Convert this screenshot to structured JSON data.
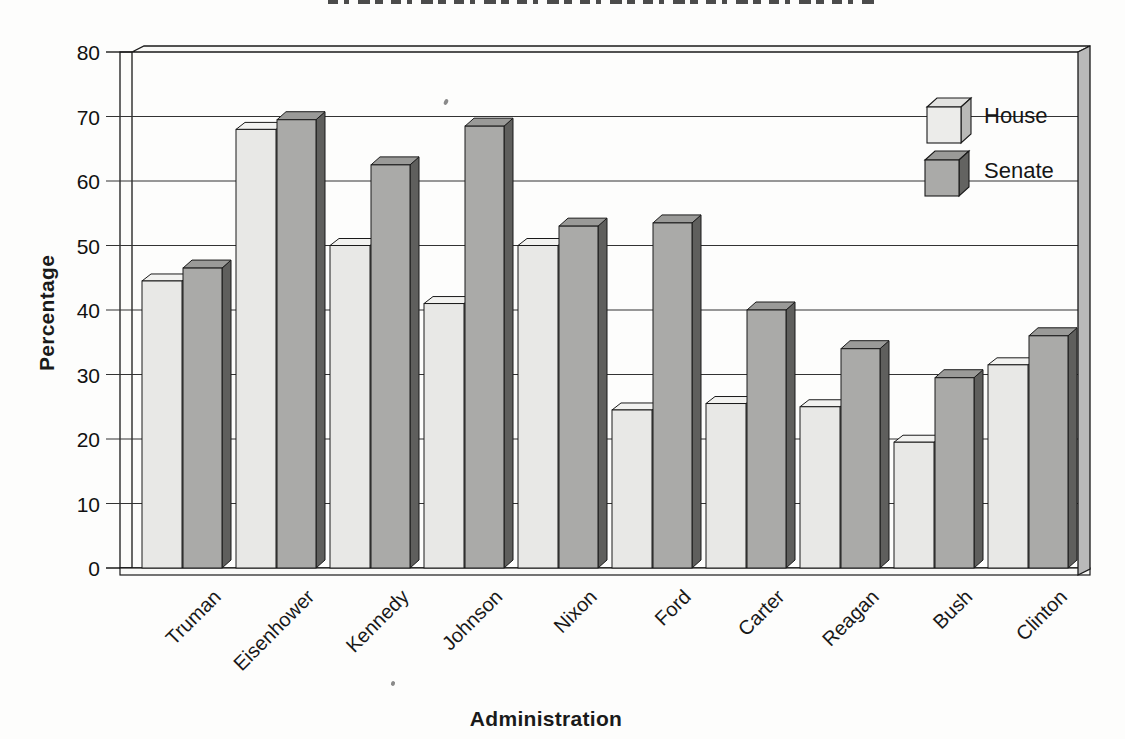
{
  "chart_data": {
    "type": "bar",
    "variant": "3d-grouped-column-scanned-print",
    "categories": [
      "Truman",
      "Eisenhower",
      "Kennedy",
      "Johnson",
      "Nixon",
      "Ford",
      "Carter",
      "Reagan",
      "Bush",
      "Clinton"
    ],
    "series": [
      {
        "name": "House",
        "values": [
          44.5,
          68.0,
          50.0,
          41.0,
          50.0,
          24.5,
          25.5,
          25.0,
          19.5,
          31.5
        ]
      },
      {
        "name": "Senate",
        "values": [
          46.5,
          69.5,
          62.5,
          68.5,
          53.0,
          53.5,
          40.0,
          34.0,
          29.5,
          36.0
        ]
      }
    ],
    "xlabel": "Administration",
    "ylabel": "Percentage",
    "ylim": [
      0,
      80
    ],
    "yticks": [
      0,
      10,
      20,
      30,
      40,
      50,
      60,
      70,
      80
    ],
    "grid": true,
    "legend_position": "top-right-inside",
    "colors": {
      "house_front": "#e8e8e6",
      "house_top": "#f2f2f0",
      "house_side": "#c2c2c0",
      "senate_front": "#aaaaa8",
      "senate_top": "#9a9a98",
      "senate_side": "#5f5f5d",
      "wall": "#b9b9b9",
      "wall_band": "#f8f8f6",
      "floor": "#fafaf8",
      "line": "#1a1a1a",
      "grid": "#333333",
      "paper": "#fdfdfc"
    }
  }
}
